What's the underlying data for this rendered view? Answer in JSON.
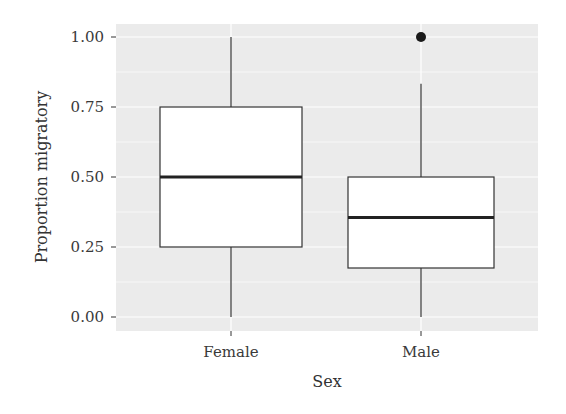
{
  "chart_data": {
    "type": "box",
    "title": "",
    "xlabel": "Sex",
    "ylabel": "Proportion migratory",
    "categories": [
      "Female",
      "Male"
    ],
    "ylim": [
      -0.05,
      1.05
    ],
    "yticks": [
      0.0,
      0.25,
      0.5,
      0.75,
      1.0
    ],
    "ytick_labels": [
      "0.00",
      "0.25",
      "0.50",
      "0.75",
      "1.00"
    ],
    "grid": true,
    "legend": null,
    "boxes": [
      {
        "category": "Female",
        "whisker_low": 0.0,
        "q1": 0.25,
        "median": 0.5,
        "q3": 0.75,
        "whisker_high": 1.0,
        "outliers": []
      },
      {
        "category": "Male",
        "whisker_low": 0.0,
        "q1": 0.175,
        "median": 0.355,
        "q3": 0.5,
        "whisker_high": 0.833,
        "outliers": [
          1.0
        ]
      }
    ],
    "colors": {
      "panel_bg": "#ebebeb",
      "grid": "#ffffff",
      "box_fill": "#ffffff",
      "box_line": "#333333",
      "outlier": "#1a1a1a"
    }
  }
}
